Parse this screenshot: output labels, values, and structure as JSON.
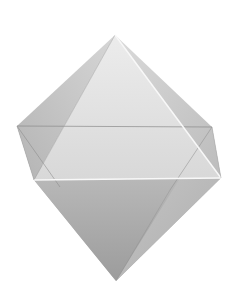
{
  "figure": {
    "style": "grayscale shaded 3D solid",
    "background": "#ffffff",
    "vertices": {
      "top": [
        115,
        35
      ],
      "back_left": [
        17,
        126
      ],
      "back_right": [
        212,
        127
      ],
      "front_left": [
        34,
        180
      ],
      "front_right": [
        221,
        178
      ],
      "bottom": [
        116,
        281
      ]
    },
    "colors": {
      "upper_front_face": "#e4e4e4",
      "upper_left_face": "#c4c4c4",
      "upper_right_face": "#cdcdcd",
      "lower_front_face": "#a9a9a9",
      "lower_right_face": "#c2c2c2",
      "edge_light": "#f8f8f8",
      "edge_dark": "#8a8a8a"
    }
  }
}
